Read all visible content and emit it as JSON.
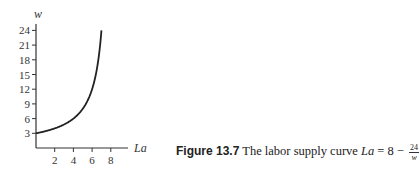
{
  "chart_data": {
    "type": "line",
    "title": "",
    "xlabel": "La",
    "ylabel": "w",
    "x_ticks": [
      2,
      4,
      6,
      8
    ],
    "y_ticks": [
      3,
      6,
      9,
      12,
      15,
      18,
      21,
      24
    ],
    "xlim": [
      0,
      9
    ],
    "ylim": [
      0,
      25
    ],
    "grid": false,
    "legend": null,
    "series": [
      {
        "name": "Labor supply curve",
        "equation": "La = 8 - 24/w",
        "x": [
          0,
          1,
          2,
          3,
          4,
          5,
          6,
          6.5,
          7
        ],
        "y": [
          3,
          3.43,
          4,
          4.8,
          6,
          8,
          12,
          16,
          24
        ]
      }
    ]
  },
  "caption": {
    "figure_label": "Figure 13.7",
    "text": "The labor supply curve",
    "equation_lhs": "La",
    "equation_eq": "= 8 −",
    "frac_num": "24",
    "frac_den": "w"
  }
}
